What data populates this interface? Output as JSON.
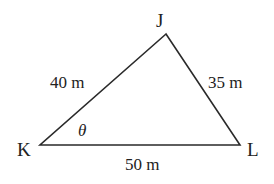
{
  "diagram": {
    "type": "triangle",
    "stroke_color": "#2a2a2a",
    "text_color": "#222222",
    "vertices": {
      "J": {
        "label": "J",
        "x": 166,
        "y": 34
      },
      "K": {
        "label": "K",
        "x": 40,
        "y": 145
      },
      "L": {
        "label": "L",
        "x": 240,
        "y": 145
      }
    },
    "sides": {
      "KJ": {
        "label": "40 m"
      },
      "JL": {
        "label": "35 m"
      },
      "KL": {
        "label": "50 m"
      }
    },
    "angle": {
      "vertex": "K",
      "label": "θ"
    }
  }
}
